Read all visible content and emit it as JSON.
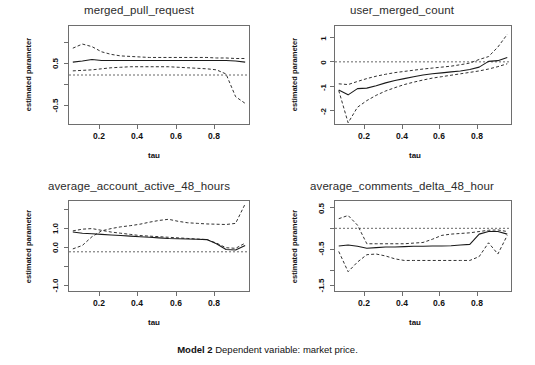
{
  "caption": {
    "model_label": "Model 2",
    "text": "Dependent variable: market price."
  },
  "axis_labels": {
    "y": "estimated parameter",
    "x": "tau"
  },
  "chart_data": [
    {
      "type": "line",
      "title": "merged_pull_request",
      "xlabel": "tau",
      "ylabel": "estimated parameter",
      "xlim": [
        0.03,
        0.97
      ],
      "ylim": [
        -0.95,
        0.95
      ],
      "xticks": [
        "0.2",
        "0.4",
        "0.6",
        "0.8"
      ],
      "xtick_values": [
        0.2,
        0.4,
        0.6,
        0.8
      ],
      "yticks": [
        "0.5",
        "-0.5"
      ],
      "ytick_values": [
        0.5,
        -0.5
      ],
      "grid": false,
      "legend": "none",
      "zero_line": 0,
      "x": [
        0.05,
        0.1,
        0.15,
        0.2,
        0.25,
        0.3,
        0.35,
        0.4,
        0.45,
        0.5,
        0.55,
        0.6,
        0.65,
        0.7,
        0.75,
        0.8,
        0.85,
        0.9,
        0.95
      ],
      "series": [
        {
          "name": "estimate",
          "style": "solid",
          "values": [
            0.25,
            0.27,
            0.3,
            0.28,
            0.28,
            0.28,
            0.28,
            0.28,
            0.28,
            0.28,
            0.28,
            0.28,
            0.28,
            0.28,
            0.28,
            0.28,
            0.28,
            0.27,
            0.25
          ]
        },
        {
          "name": "upper_ci",
          "style": "dashed",
          "values": [
            0.52,
            0.6,
            0.55,
            0.45,
            0.4,
            0.37,
            0.36,
            0.35,
            0.34,
            0.34,
            0.34,
            0.34,
            0.34,
            0.34,
            0.34,
            0.33,
            0.33,
            0.32,
            0.32
          ]
        },
        {
          "name": "lower_ci",
          "style": "dashed",
          "values": [
            0.08,
            0.09,
            0.1,
            0.12,
            0.14,
            0.15,
            0.16,
            0.16,
            0.16,
            0.16,
            0.16,
            0.15,
            0.14,
            0.13,
            0.12,
            0.1,
            0.02,
            -0.42,
            -0.55
          ]
        }
      ]
    },
    {
      "type": "line",
      "title": "user_merged_count",
      "xlabel": "tau",
      "ylabel": "estimated parameter",
      "xlim": [
        0.03,
        0.97
      ],
      "ylim": [
        -2.6,
        1.5
      ],
      "xticks": [
        "0.2",
        "0.4",
        "0.6",
        "0.8"
      ],
      "xtick_values": [
        0.2,
        0.4,
        0.6,
        0.8
      ],
      "yticks": [
        "1",
        "0",
        "-1",
        "-2"
      ],
      "ytick_values": [
        1,
        0,
        -1,
        -2
      ],
      "grid": false,
      "legend": "none",
      "zero_line": 0,
      "x": [
        0.05,
        0.1,
        0.15,
        0.2,
        0.25,
        0.3,
        0.35,
        0.4,
        0.45,
        0.5,
        0.55,
        0.6,
        0.65,
        0.7,
        0.75,
        0.8,
        0.85,
        0.9,
        0.95
      ],
      "series": [
        {
          "name": "estimate",
          "style": "solid",
          "values": [
            -1.18,
            -1.38,
            -1.12,
            -1.1,
            -1.0,
            -0.88,
            -0.78,
            -0.7,
            -0.62,
            -0.55,
            -0.5,
            -0.46,
            -0.42,
            -0.38,
            -0.32,
            -0.22,
            0.02,
            0.05,
            0.18
          ]
        },
        {
          "name": "upper_ci",
          "style": "dashed",
          "values": [
            -0.92,
            -0.95,
            -0.82,
            -0.7,
            -0.6,
            -0.52,
            -0.45,
            -0.4,
            -0.35,
            -0.3,
            -0.26,
            -0.22,
            -0.18,
            -0.12,
            -0.05,
            0.1,
            0.22,
            0.62,
            1.15
          ]
        },
        {
          "name": "lower_ci",
          "style": "dashed",
          "values": [
            -1.2,
            -2.55,
            -1.9,
            -1.62,
            -1.4,
            -1.22,
            -1.08,
            -0.95,
            -0.85,
            -0.76,
            -0.68,
            -0.62,
            -0.56,
            -0.5,
            -0.44,
            -0.38,
            -0.3,
            -0.2,
            -0.08
          ]
        }
      ]
    },
    {
      "type": "line",
      "title": "average_account_active_48_hours",
      "xlabel": "tau",
      "ylabel": "estimated parameter",
      "xlim": [
        0.03,
        0.97
      ],
      "ylim": [
        -1.35,
        1.75
      ],
      "xticks": [
        "0.2",
        "0.4",
        "0.6",
        "0.8"
      ],
      "xtick_values": [
        0.2,
        0.4,
        0.6,
        0.8
      ],
      "yticks": [
        "1.0",
        "0.0",
        "-1.0"
      ],
      "ytick_values": [
        1.0,
        0.0,
        -1.0
      ],
      "grid": false,
      "legend": "none",
      "zero_line": 0,
      "x": [
        0.05,
        0.1,
        0.15,
        0.2,
        0.25,
        0.3,
        0.35,
        0.4,
        0.45,
        0.5,
        0.55,
        0.6,
        0.65,
        0.7,
        0.75,
        0.8,
        0.85,
        0.9,
        0.95
      ],
      "series": [
        {
          "name": "estimate",
          "style": "solid",
          "values": [
            0.68,
            0.64,
            0.62,
            0.6,
            0.58,
            0.56,
            0.54,
            0.52,
            0.5,
            0.48,
            0.46,
            0.45,
            0.44,
            0.43,
            0.42,
            0.28,
            0.08,
            0.06,
            0.22
          ]
        },
        {
          "name": "upper_ci",
          "style": "dashed",
          "values": [
            0.72,
            0.78,
            0.8,
            0.74,
            0.68,
            0.64,
            0.6,
            0.56,
            0.54,
            0.52,
            0.5,
            0.48,
            0.46,
            0.44,
            0.42,
            0.3,
            0.14,
            0.12,
            0.3
          ]
        },
        {
          "name": "lower_ci",
          "style": "dashed",
          "values": [
            0.1,
            0.22,
            0.52,
            0.72,
            0.8,
            0.86,
            0.9,
            0.95,
            1.02,
            1.08,
            1.12,
            1.05,
            1.0,
            0.98,
            0.96,
            0.95,
            0.94,
            0.98,
            1.65
          ]
        }
      ]
    },
    {
      "type": "line",
      "title": "average_comments_delta_48_hour",
      "xlabel": "tau",
      "ylabel": "estimated parameter",
      "xlim": [
        0.03,
        0.97
      ],
      "ylim": [
        -1.95,
        0.85
      ],
      "xticks": [
        "0.2",
        "0.4",
        "0.6",
        "0.8"
      ],
      "xtick_values": [
        0.2,
        0.4,
        0.6,
        0.8
      ],
      "yticks": [
        "0.5",
        "-0.5",
        "-1.5"
      ],
      "ytick_values": [
        0.5,
        -0.5,
        -1.5
      ],
      "grid": false,
      "legend": "none",
      "zero_line": 0,
      "x": [
        0.05,
        0.1,
        0.15,
        0.2,
        0.25,
        0.3,
        0.35,
        0.4,
        0.45,
        0.5,
        0.55,
        0.6,
        0.65,
        0.7,
        0.75,
        0.8,
        0.85,
        0.9,
        0.95
      ],
      "series": [
        {
          "name": "estimate",
          "style": "solid",
          "values": [
            -0.55,
            -0.52,
            -0.56,
            -0.62,
            -0.6,
            -0.58,
            -0.58,
            -0.57,
            -0.56,
            -0.56,
            -0.55,
            -0.55,
            -0.54,
            -0.52,
            -0.5,
            -0.18,
            -0.1,
            -0.1,
            -0.18
          ]
        },
        {
          "name": "upper_ci",
          "style": "dashed",
          "values": [
            0.3,
            0.4,
            0.1,
            -0.48,
            -0.48,
            -0.48,
            -0.48,
            -0.48,
            -0.46,
            -0.44,
            -0.34,
            -0.22,
            -0.18,
            -0.16,
            -0.14,
            -0.1,
            -0.06,
            -0.05,
            -0.1
          ]
        },
        {
          "name": "lower_ci",
          "style": "dashed",
          "values": [
            -0.72,
            -1.35,
            -1.05,
            -0.82,
            -0.8,
            -0.86,
            -0.95,
            -1.0,
            -1.0,
            -1.0,
            -1.0,
            -1.0,
            -1.0,
            -1.0,
            -1.0,
            -0.88,
            -0.45,
            -0.8,
            -0.22
          ]
        }
      ]
    }
  ]
}
